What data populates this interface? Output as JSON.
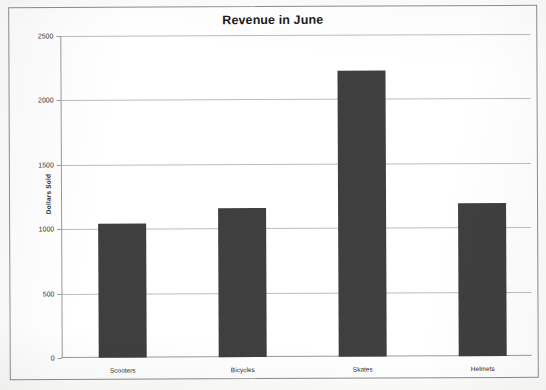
{
  "chart_data": {
    "type": "bar",
    "title": "Revenue in June",
    "xlabel": "",
    "ylabel": "Dollars Sold",
    "categories": [
      "Scooters",
      "Bicycles",
      "Skates",
      "Helmets"
    ],
    "values": [
      1040,
      1155,
      2220,
      1190
    ],
    "ylim": [
      0,
      2500
    ],
    "ytick_labels": [
      "2500",
      "2000",
      "1500",
      "1000",
      "500",
      "0"
    ],
    "ytick_values": [
      2500,
      2000,
      1500,
      1000,
      500,
      0
    ],
    "grid": true,
    "legend": false,
    "bar_color": "#3f3f3f",
    "gridline_color": "#bdbdbd",
    "axis_color": "#9a9a9a"
  }
}
